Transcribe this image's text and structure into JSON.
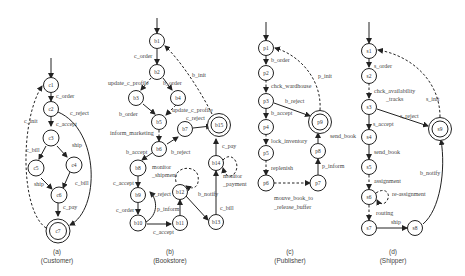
{
  "panels": [
    {
      "id": "a",
      "caption_letter": "(a)",
      "caption_name": "(Customer)",
      "states": [
        "c1",
        "c2",
        "c3",
        "c4",
        "c5",
        "c6",
        "c7"
      ],
      "final_states": [
        "c7"
      ],
      "transitions": [
        {
          "from": "c1",
          "to": "c2",
          "label": "c_order",
          "style": "solid"
        },
        {
          "from": "c2",
          "to": "c3",
          "label": "c_accept",
          "style": "solid"
        },
        {
          "from": "c2",
          "to": "c7",
          "label": "c_reject",
          "style": "solid"
        },
        {
          "from": "c3",
          "to": "c5",
          "label": "c_bill",
          "style": "solid"
        },
        {
          "from": "c3",
          "to": "c4",
          "label": "ship",
          "style": "solid"
        },
        {
          "from": "c5",
          "to": "c6",
          "label": "ship",
          "style": "solid"
        },
        {
          "from": "c4",
          "to": "c6",
          "label": "c_bill",
          "style": "solid"
        },
        {
          "from": "c6",
          "to": "c7",
          "label": "c_pay",
          "style": "solid"
        },
        {
          "from": "c7",
          "to": "c1",
          "label": "c_init",
          "style": "dashed"
        }
      ]
    },
    {
      "id": "b",
      "caption_letter": "(b)",
      "caption_name": "(Bookstore)",
      "states": [
        "b1",
        "b2",
        "b3",
        "b4",
        "b5",
        "b6",
        "b7",
        "b8",
        "b9",
        "b10",
        "b11",
        "b12",
        "b13",
        "b14",
        "b15"
      ],
      "final_states": [
        "b15"
      ],
      "transitions": [
        {
          "from": "b1",
          "to": "b2",
          "label": "c_order",
          "style": "solid"
        },
        {
          "from": "b2",
          "to": "b3",
          "label": "update_c_profile",
          "style": "dashed"
        },
        {
          "from": "b2",
          "to": "b4",
          "label": "b_order",
          "style": "solid"
        },
        {
          "from": "b3",
          "to": "b5",
          "label": "b_order",
          "style": "solid"
        },
        {
          "from": "b4",
          "to": "b5",
          "label": "update_c_profile",
          "style": "dashed"
        },
        {
          "from": "b5",
          "to": "b6",
          "label": "inform_marketing",
          "style": "dashed"
        },
        {
          "from": "b6",
          "to": "b7",
          "label": "b_reject",
          "style": "solid"
        },
        {
          "from": "b6",
          "to": "b8",
          "label": "b_accept",
          "style": "solid"
        },
        {
          "from": "b7",
          "to": "b15",
          "label": "c_reject",
          "style": "solid"
        },
        {
          "from": "b8",
          "to": "b9",
          "label": "c_accept",
          "style": "solid"
        },
        {
          "from": "b8",
          "to": "b8",
          "label": "monitor_shipment",
          "style": "dashed"
        },
        {
          "from": "b9",
          "to": "b10",
          "label": "c_order",
          "style": "solid"
        },
        {
          "from": "b10",
          "to": "b9",
          "label": "c_reject",
          "style": "solid"
        },
        {
          "from": "b10",
          "to": "b11",
          "label": "c_accept",
          "style": "solid"
        },
        {
          "from": "b11",
          "to": "b12",
          "label": "p_inform",
          "style": "solid"
        },
        {
          "from": "b12",
          "to": "b12",
          "label": "",
          "style": "dashed"
        },
        {
          "from": "b12",
          "to": "b13",
          "label": "b_notify",
          "style": "solid"
        },
        {
          "from": "b13",
          "to": "b14",
          "label": "c_bill",
          "style": "solid"
        },
        {
          "from": "b14",
          "to": "b14",
          "label": "monitor_payment",
          "style": "dashed"
        },
        {
          "from": "b14",
          "to": "b15",
          "label": "c_pay",
          "style": "solid"
        },
        {
          "from": "b15",
          "to": "b1",
          "label": "b_init",
          "style": "dashed"
        }
      ]
    },
    {
      "id": "c",
      "caption_letter": "(c)",
      "caption_name": "(Publisher)",
      "states": [
        "p1",
        "p2",
        "p3",
        "p4",
        "p5",
        "p6",
        "p7",
        "p8",
        "p9"
      ],
      "final_states": [
        "p9"
      ],
      "transitions": [
        {
          "from": "p1",
          "to": "p2",
          "label": "b_order",
          "style": "solid"
        },
        {
          "from": "p2",
          "to": "p3",
          "label": "chck_wardhouse",
          "style": "dashed"
        },
        {
          "from": "p3",
          "to": "p4",
          "label": "b_accept",
          "style": "solid"
        },
        {
          "from": "p3",
          "to": "p9",
          "label": "b_reject",
          "style": "solid"
        },
        {
          "from": "p4",
          "to": "p5",
          "label": "lock_inventory",
          "style": "dashed"
        },
        {
          "from": "p5",
          "to": "p6",
          "label": "replenish",
          "style": "dashed"
        },
        {
          "from": "p6",
          "to": "p7",
          "label": "mouve_book_to_release_buffer",
          "style": "dashed"
        },
        {
          "from": "p7",
          "to": "p8",
          "label": "p_inform",
          "style": "solid"
        },
        {
          "from": "p8",
          "to": "p9",
          "label": "send_book",
          "style": "solid"
        },
        {
          "from": "p9",
          "to": "p1",
          "label": "p_init",
          "style": "dashed"
        }
      ]
    },
    {
      "id": "d",
      "caption_letter": "(d)",
      "caption_name": "(Shipper)",
      "states": [
        "s1",
        "s2",
        "s3",
        "s4",
        "s5",
        "s6",
        "s7",
        "s8",
        "s9"
      ],
      "final_states": [
        "s9"
      ],
      "transitions": [
        {
          "from": "s1",
          "to": "s2",
          "label": "s_order",
          "style": "solid"
        },
        {
          "from": "s2",
          "to": "s3",
          "label": "chck_availability_tracks",
          "style": "dashed"
        },
        {
          "from": "s3",
          "to": "s4",
          "label": "s_accept",
          "style": "solid"
        },
        {
          "from": "s3",
          "to": "s9",
          "label": "s_reject",
          "style": "solid"
        },
        {
          "from": "s4",
          "to": "s5",
          "label": "send_book",
          "style": "solid"
        },
        {
          "from": "s5",
          "to": "s6",
          "label": "assignment",
          "style": "dashed"
        },
        {
          "from": "s6",
          "to": "s6",
          "label": "re-assignment",
          "style": "dashed"
        },
        {
          "from": "s6",
          "to": "s7",
          "label": "routing",
          "style": "dashed"
        },
        {
          "from": "s7",
          "to": "s8",
          "label": "ship",
          "style": "solid"
        },
        {
          "from": "s8",
          "to": "s9",
          "label": "b_notify",
          "style": "solid"
        },
        {
          "from": "s9",
          "to": "s1",
          "label": "s_init",
          "style": "dashed"
        }
      ]
    }
  ],
  "labels": {
    "c1": "c1",
    "c2": "c2",
    "c3": "c3",
    "c4": "c4",
    "c5": "c5",
    "c6": "c6",
    "c7": "c7",
    "b1": "b1",
    "b2": "b2",
    "b3": "b3",
    "b4": "b4",
    "b5": "b5",
    "b6": "b6",
    "b7": "b7",
    "b8": "b8",
    "b9": "b9",
    "b10": "b10",
    "b11": "b11",
    "b12": "b12",
    "b13": "b13",
    "b14": "b14",
    "b15": "b15",
    "p1": "p1",
    "p2": "p2",
    "p3": "p3",
    "p4": "p4",
    "p5": "p5",
    "p6": "p6",
    "p7": "p7",
    "p8": "p8",
    "p9": "p9",
    "s1": "s1",
    "s2": "s2",
    "s3": "s3",
    "s4": "s4",
    "s5": "s5",
    "s6": "s6",
    "s7": "s7",
    "s8": "s8",
    "s9": "s9",
    "e_c_order": "c_order",
    "e_c_accept": "c_accept",
    "e_c_reject": "c_reject",
    "e_c_bill_l": "c_bill",
    "e_ship_r": "ship",
    "e_ship_l": "ship",
    "e_c_bill_r": "c_bill",
    "e_c_pay": "c_pay",
    "e_c_init": "c_init",
    "e_b_c_order": "c_order",
    "e_b_upd1": "update_c_profile",
    "e_b_order1": "b_order",
    "e_b_order2": "b_order",
    "e_b_upd2": "update_c_profile",
    "e_b_inform": "inform_marketing",
    "e_b_reject": "b_reject",
    "e_b_accept": "b_accept",
    "e_b_c_reject1": "c_reject",
    "e_b_monitor1": "monitor",
    "e_b_monitor2": "_shipment",
    "e_b_c_accept": "c_accept",
    "e_b_c_order2": "c_order",
    "e_b_c_reject2": "c_reject",
    "e_b_c_accept2": "c_accept",
    "e_b_p_inform": "p_inform",
    "e_b_notify": "b_notify",
    "e_b_c_bill": "c_bill",
    "e_b_monp1": "monitor",
    "e_b_monp2": "_payment",
    "e_b_c_pay": "c_pay",
    "e_b_init": "b_init",
    "e_p_b_order": "b_order",
    "e_p_chck": "chck_wardhouse",
    "e_p_accept": "b_accept",
    "e_p_reject": "b_reject",
    "e_p_lock": "lock_inventory",
    "e_p_repl": "replenish",
    "e_p_move1": "mouve_book_to",
    "e_p_move2": "_release_buffer",
    "e_p_inform": "p_inform",
    "e_p_send": "send_book",
    "e_p_init": "p_init",
    "e_s_order": "s_order",
    "e_s_chck1": "chck_availability",
    "e_s_chck2": "_tracks",
    "e_s_accept": "s_accept",
    "e_s_reject": "s_reject",
    "e_s_send": "send_book",
    "e_s_assign": "assignment",
    "e_s_reassign": "re-assignment",
    "e_s_routing": "routing",
    "e_s_ship": "ship",
    "e_s_notify": "b_notify",
    "e_s_init": "s_init"
  },
  "captions": {
    "a_letter": "(a)",
    "a_name": "(Customer)",
    "b_letter": "(b)",
    "b_name": "(Bookstore)",
    "c_letter": "(c)",
    "c_name": "(Publisher)",
    "d_letter": "(d)",
    "d_name": "(Shipper)"
  }
}
